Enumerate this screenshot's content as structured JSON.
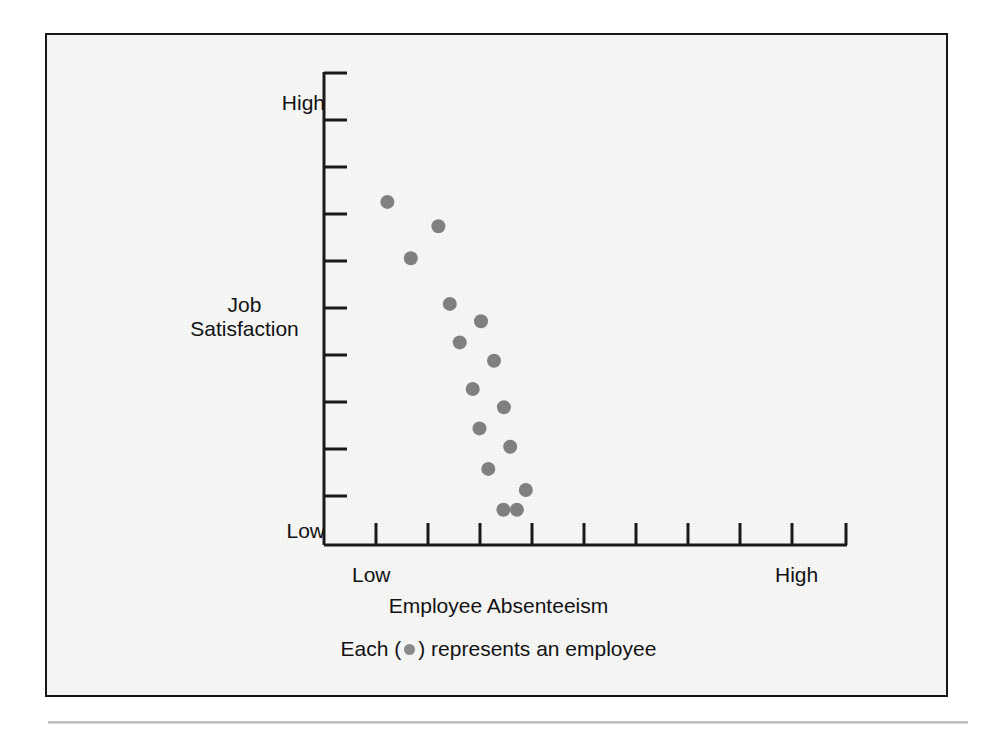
{
  "figure": {
    "panel_background": "#f6f6f5",
    "frame_color": "#17171a",
    "rule_color": "#c0c0c0"
  },
  "chart_data": {
    "type": "scatter",
    "title": "",
    "subtitle": "",
    "xlabel": "Employee Absenteeism",
    "ylabel": "Job Satisfaction",
    "ylabel_line1": "Job",
    "ylabel_line2": "Satisfaction",
    "x_tick_labels": [
      "Low",
      "High"
    ],
    "y_tick_labels": [
      "High",
      "Low"
    ],
    "x_low_label": "Low",
    "x_high_label": "High",
    "y_high_label": "High",
    "y_low_label": "Low",
    "grid": false,
    "legend_position": "below-axis",
    "legend_text_before": "Each (",
    "legend_text_after": ") represents an employee",
    "legend_marker": "filled-circle",
    "marker_color": "#808080",
    "marker_radius": 7,
    "axis_color": "#1a1a1c",
    "x_tick_count": 10,
    "y_tick_count": 10,
    "xlim": [
      0,
      10
    ],
    "ylim": [
      0,
      10
    ],
    "point_count": 18,
    "relationship": "negative",
    "points": [
      {
        "x": 1.22,
        "y": 7.3
      },
      {
        "x": 2.2,
        "y": 6.78
      },
      {
        "x": 1.67,
        "y": 6.1
      },
      {
        "x": 2.42,
        "y": 5.13
      },
      {
        "x": 3.02,
        "y": 4.76
      },
      {
        "x": 2.61,
        "y": 4.31
      },
      {
        "x": 3.27,
        "y": 3.92
      },
      {
        "x": 2.86,
        "y": 3.32
      },
      {
        "x": 3.46,
        "y": 2.93
      },
      {
        "x": 2.99,
        "y": 2.48
      },
      {
        "x": 3.58,
        "y": 2.09
      },
      {
        "x": 3.16,
        "y": 1.62
      },
      {
        "x": 3.88,
        "y": 1.17
      },
      {
        "x": 3.45,
        "y": 0.75
      },
      {
        "x": 3.71,
        "y": 0.75
      }
    ]
  }
}
